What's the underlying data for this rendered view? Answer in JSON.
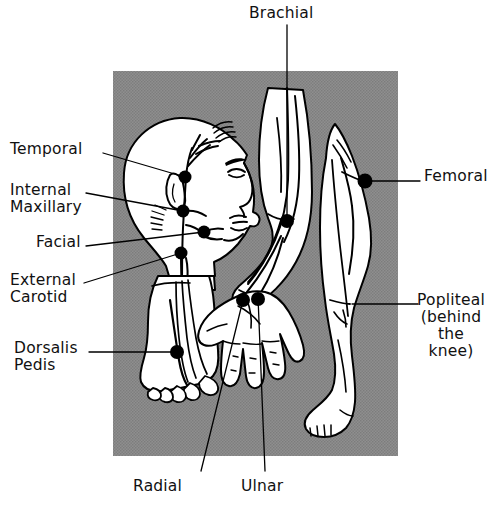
{
  "figure": {
    "kind": "anatomical-line-diagram",
    "canvas": {
      "width": 499,
      "height": 505
    },
    "background_color": "#ffffff",
    "panel_color": "#8b8b8b",
    "ink_color": "#000000",
    "skin_fill": "#ffffff",
    "panel": {
      "x": 113,
      "y": 71,
      "width": 285,
      "height": 385
    }
  },
  "labels": [
    {
      "id": "temporal",
      "text": "Temporal",
      "align": "left",
      "x": 10,
      "y": 141,
      "leader": [
        [
          103,
          153
        ],
        [
          185,
          177
        ]
      ],
      "marker": [
        185,
        177
      ]
    },
    {
      "id": "internal-maxillary",
      "text": "Internal\nMaxillary",
      "align": "left",
      "x": 10,
      "y": 182,
      "leader": [
        [
          86,
          193
        ],
        [
          183,
          211
        ]
      ],
      "marker": [
        183,
        211
      ]
    },
    {
      "id": "facial",
      "text": "Facial",
      "align": "left",
      "x": 36,
      "y": 234,
      "leader": [
        [
          86,
          246
        ],
        [
          204,
          232
        ]
      ],
      "marker": [
        204,
        232
      ]
    },
    {
      "id": "external-carotid",
      "text": "External\nCarotid",
      "align": "left",
      "x": 10,
      "y": 272,
      "leader": [
        [
          84,
          283
        ],
        [
          181,
          253
        ]
      ],
      "marker": [
        181,
        253
      ]
    },
    {
      "id": "dorsalis-pedis",
      "text": "Dorsalis\nPedis",
      "align": "left",
      "x": 14,
      "y": 340,
      "leader": [
        [
          89,
          352
        ],
        [
          177,
          352
        ]
      ],
      "marker": [
        177,
        352
      ]
    },
    {
      "id": "brachial",
      "text": "Brachial",
      "align": "center",
      "x": 249,
      "y": 5,
      "leader": [
        [
          287,
          25
        ],
        [
          287,
          221
        ]
      ],
      "marker": [
        287,
        221
      ]
    },
    {
      "id": "femoral",
      "text": "Femoral",
      "align": "left",
      "x": 424,
      "y": 168,
      "leader": [
        [
          420,
          181
        ],
        [
          365,
          181
        ]
      ],
      "marker": [
        365,
        181
      ]
    },
    {
      "id": "popliteal",
      "text": "Popliteal\n(behind\nthe\nknee)",
      "align": "left",
      "x": 421,
      "y": 292,
      "leader": [
        [
          418,
          304
        ],
        [
          352,
          304
        ]
      ],
      "marker": null
    },
    {
      "id": "radial",
      "text": "Radial",
      "align": "center",
      "x": 133,
      "y": 478,
      "leader": [
        [
          201,
          471
        ],
        [
          243,
          300
        ]
      ],
      "marker": [
        243,
        300
      ]
    },
    {
      "id": "ulnar",
      "text": "Ulnar",
      "align": "center",
      "x": 241,
      "y": 478,
      "leader": [
        [
          265,
          471
        ],
        [
          258,
          297
        ]
      ],
      "marker": [
        258,
        297
      ]
    }
  ],
  "pulse_points": [
    {
      "id": "temporal",
      "name": "Temporal",
      "x": 185,
      "y": 177,
      "r": 6.5
    },
    {
      "id": "internal-maxillary",
      "name": "Internal Maxillary",
      "x": 183,
      "y": 211,
      "r": 6.5
    },
    {
      "id": "facial",
      "name": "Facial",
      "x": 204,
      "y": 232,
      "r": 6.5
    },
    {
      "id": "external-carotid",
      "name": "External Carotid",
      "x": 181,
      "y": 253,
      "r": 6.5
    },
    {
      "id": "dorsalis-pedis",
      "name": "Dorsalis Pedis",
      "x": 177,
      "y": 352,
      "r": 7
    },
    {
      "id": "brachial",
      "name": "Brachial",
      "x": 287,
      "y": 221,
      "r": 7
    },
    {
      "id": "femoral",
      "name": "Femoral",
      "x": 365,
      "y": 181,
      "r": 7.5
    },
    {
      "id": "radial",
      "name": "Radial",
      "x": 243,
      "y": 300,
      "r": 7
    },
    {
      "id": "ulnar",
      "name": "Ulnar",
      "x": 258,
      "y": 299,
      "r": 7
    }
  ],
  "body_parts": [
    "head-profile",
    "left-foot-dorsal",
    "right-arm",
    "right-hand",
    "right-leg"
  ]
}
